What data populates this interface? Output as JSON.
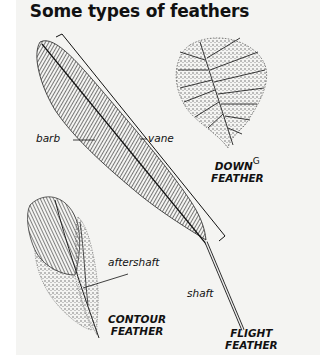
{
  "title": "Some types of feathers",
  "labels": {
    "barb": "barb",
    "vane": "vane",
    "aftershaft": "aftershaft",
    "shaft": "shaft"
  },
  "captions": {
    "down": {
      "line1": "DOWN",
      "marker": "G",
      "line2": "FEATHER"
    },
    "contour": {
      "line1": "CONTOUR",
      "line2": "FEATHER"
    },
    "flight": {
      "line1": "FLIGHT",
      "line2": "FEATHER"
    }
  },
  "colors": {
    "ink": "#111111",
    "background": "#f4f4f2"
  }
}
